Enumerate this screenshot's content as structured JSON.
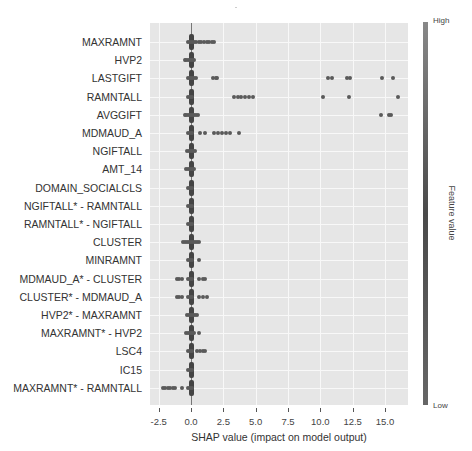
{
  "chart_data": {
    "type": "scatter",
    "subtype": "shap_summary_beeswarm",
    "title": "",
    "xlabel": "SHAP value (impact on model output)",
    "ylabel": "",
    "xlim": [
      -3.3,
      16.8
    ],
    "xticks": [
      -2.5,
      0.0,
      2.5,
      5.0,
      7.5,
      10.0,
      12.5,
      15.0
    ],
    "xtick_labels": [
      "-2.5",
      "0.0",
      "2.5",
      "5.0",
      "7.5",
      "10.0",
      "12.5",
      "15.0"
    ],
    "grid": true,
    "colorbar": {
      "label": "Feature value",
      "high": "High",
      "low": "Low"
    },
    "features": [
      {
        "name": "MAXRAMNT",
        "spread": [
          -0.2,
          0.3
        ],
        "outliers": [
          0.4,
          0.6,
          0.8,
          1.0,
          1.2,
          1.4,
          1.6,
          1.8
        ]
      },
      {
        "name": "HVP2",
        "spread": [
          -0.5,
          0.3
        ],
        "outliers": []
      },
      {
        "name": "LASTGIFT",
        "spread": [
          -0.2,
          0.4
        ],
        "outliers": [
          1.7,
          1.9,
          2.0,
          10.6,
          10.9,
          12.1,
          12.3,
          14.8,
          15.6
        ]
      },
      {
        "name": "RAMNTALL",
        "spread": [
          -0.2,
          0.2
        ],
        "outliers": [
          3.3,
          3.6,
          3.9,
          4.2,
          4.5,
          4.8,
          10.2,
          12.2,
          16.0
        ]
      },
      {
        "name": "AVGGIFT",
        "spread": [
          -0.5,
          0.6
        ],
        "outliers": [
          14.7,
          15.3,
          15.5
        ]
      },
      {
        "name": "MDMAUD_A",
        "spread": [
          -0.2,
          0.2
        ],
        "outliers": [
          0.7,
          1.1,
          1.8,
          2.1,
          2.4,
          2.7,
          3.0,
          3.7
        ]
      },
      {
        "name": "NGIFTALL",
        "spread": [
          -0.3,
          0.3
        ],
        "outliers": []
      },
      {
        "name": "AMT_14",
        "spread": [
          -0.4,
          0.3
        ],
        "outliers": []
      },
      {
        "name": "DOMAIN_SOCIALCLS",
        "spread": [
          -0.2,
          0.2
        ],
        "outliers": []
      },
      {
        "name": "NGIFTALL* - RAMNTALL",
        "spread": [
          -0.2,
          0.2
        ],
        "outliers": []
      },
      {
        "name": "RAMNTALL* - NGIFTALL",
        "spread": [
          -0.2,
          0.2
        ],
        "outliers": []
      },
      {
        "name": "CLUSTER",
        "spread": [
          -0.6,
          0.6
        ],
        "outliers": []
      },
      {
        "name": "MINRAMNT",
        "spread": [
          -0.2,
          0.2
        ],
        "outliers": [
          0.6
        ]
      },
      {
        "name": "MDMAUD_A* - CLUSTER",
        "spread": [
          -0.2,
          0.2
        ],
        "outliers": [
          -1.1,
          -0.9,
          -0.7,
          0.6,
          0.9,
          1.1
        ]
      },
      {
        "name": "CLUSTER* - MDMAUD_A",
        "spread": [
          -0.2,
          0.2
        ],
        "outliers": [
          -1.1,
          -0.9,
          -0.7,
          0.6,
          0.9,
          1.2
        ]
      },
      {
        "name": "HVP2* - MAXRAMNT",
        "spread": [
          -0.3,
          0.3
        ],
        "outliers": [
          0.5
        ]
      },
      {
        "name": "MAXRAMNT* - HVP2",
        "spread": [
          -0.4,
          0.3
        ],
        "outliers": [
          0.6
        ]
      },
      {
        "name": "LSC4",
        "spread": [
          -0.2,
          0.2
        ],
        "outliers": [
          0.5,
          0.7,
          0.9,
          1.1
        ]
      },
      {
        "name": "IC15",
        "spread": [
          -0.2,
          0.2
        ],
        "outliers": []
      },
      {
        "name": "MAXRAMNT* - RAMNTALL",
        "spread": [
          -0.2,
          0.2
        ],
        "outliers": [
          -2.2,
          -2.0,
          -1.8,
          -1.6,
          -1.4,
          -1.2,
          -0.7
        ]
      }
    ]
  }
}
